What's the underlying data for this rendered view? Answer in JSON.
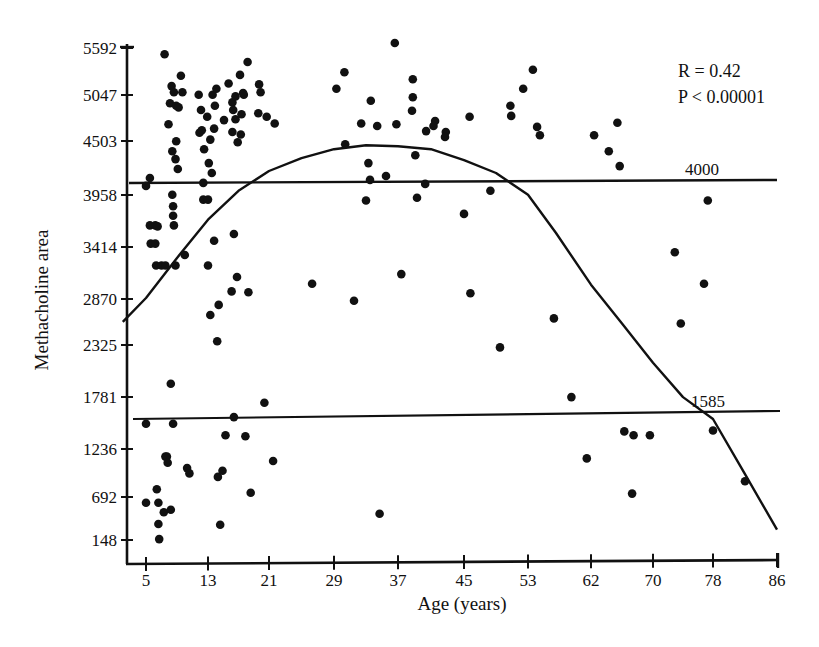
{
  "chart_data": {
    "type": "scatter",
    "title": "",
    "xlabel": "Age (years)",
    "ylabel": "Methacholine area",
    "x_ticks": [
      5,
      13,
      21,
      29,
      37,
      45,
      53,
      62,
      70,
      78,
      86
    ],
    "y_ticks": [
      148,
      692,
      1236,
      1781,
      2325,
      2870,
      3414,
      3958,
      4503,
      5047,
      5592
    ],
    "xlim": [
      2,
      86
    ],
    "ylim": [
      -100,
      5592
    ],
    "grid": false,
    "annotations": {
      "r_text": "R = 0.42",
      "p_text": "P < 0.00001"
    },
    "reference_lines": [
      {
        "label": "4000",
        "y_start": 4080,
        "y_end": 4100
      },
      {
        "label": "1585",
        "y_start": 1585,
        "y_end": 1640
      }
    ],
    "fit_curve": {
      "type": "quadratic",
      "points": [
        [
          2,
          2600
        ],
        [
          5,
          2880
        ],
        [
          9,
          3300
        ],
        [
          13,
          3700
        ],
        [
          17,
          4000
        ],
        [
          21,
          4200
        ],
        [
          25,
          4330
        ],
        [
          29,
          4420
        ],
        [
          33,
          4460
        ],
        [
          37,
          4450
        ],
        [
          41,
          4420
        ],
        [
          45,
          4310
        ],
        [
          49,
          4180
        ],
        [
          53,
          3960
        ],
        [
          57,
          3560
        ],
        [
          62,
          3020
        ],
        [
          66,
          2580
        ],
        [
          70,
          2140
        ],
        [
          74,
          1780
        ],
        [
          78,
          1550
        ],
        [
          82,
          950
        ],
        [
          86,
          280
        ]
      ]
    },
    "points": [
      [
        5,
        4050
      ],
      [
        5.5,
        4130
      ],
      [
        5,
        1500
      ],
      [
        5,
        620
      ],
      [
        5.5,
        3640
      ],
      [
        6.2,
        3640
      ],
      [
        5.6,
        3450
      ],
      [
        6.2,
        3450
      ],
      [
        6.3,
        3220
      ],
      [
        6.5,
        3630
      ],
      [
        7,
        3220
      ],
      [
        7.5,
        3220
      ],
      [
        6.4,
        780
      ],
      [
        6.6,
        620
      ],
      [
        6.7,
        160
      ],
      [
        6.6,
        350
      ],
      [
        7.4,
        5520
      ],
      [
        7.5,
        1150
      ],
      [
        7.7,
        1150
      ],
      [
        7.8,
        1080
      ],
      [
        7.3,
        500
      ],
      [
        8.2,
        530
      ],
      [
        8.2,
        1920
      ],
      [
        8.5,
        1500
      ],
      [
        7.9,
        4700
      ],
      [
        8.1,
        4950
      ],
      [
        8.3,
        5150
      ],
      [
        8.6,
        5080
      ],
      [
        8.9,
        4920
      ],
      [
        8.4,
        4400
      ],
      [
        8.8,
        4320
      ],
      [
        8.9,
        4500
      ],
      [
        9.2,
        4900
      ],
      [
        9.5,
        5270
      ],
      [
        9.7,
        5080
      ],
      [
        8.4,
        3960
      ],
      [
        8.5,
        3840
      ],
      [
        8.5,
        3740
      ],
      [
        8.6,
        3640
      ],
      [
        8.8,
        3220
      ],
      [
        9.1,
        4220
      ],
      [
        10,
        3330
      ],
      [
        10.3,
        1020
      ],
      [
        10.6,
        960
      ],
      [
        11.8,
        5050
      ],
      [
        12.1,
        4870
      ],
      [
        11.9,
        4600
      ],
      [
        12.5,
        4420
      ],
      [
        12.2,
        4630
      ],
      [
        12.9,
        4790
      ],
      [
        12.4,
        3910
      ],
      [
        13,
        3910
      ],
      [
        13.3,
        4520
      ],
      [
        13.8,
        4650
      ],
      [
        13.1,
        4280
      ],
      [
        13.9,
        4920
      ],
      [
        13.6,
        5050
      ],
      [
        14.1,
        5120
      ],
      [
        12.4,
        4080
      ],
      [
        13.5,
        4180
      ],
      [
        13.3,
        2680
      ],
      [
        13,
        3220
      ],
      [
        13.8,
        3480
      ],
      [
        14.2,
        2370
      ],
      [
        14.3,
        920
      ],
      [
        14.6,
        340
      ],
      [
        14.4,
        2800
      ],
      [
        15.3,
        1380
      ],
      [
        14.9,
        990
      ],
      [
        15.1,
        4750
      ],
      [
        15.7,
        5180
      ],
      [
        16.2,
        4960
      ],
      [
        16.3,
        4870
      ],
      [
        16.2,
        4610
      ],
      [
        16.6,
        4760
      ],
      [
        16.9,
        4490
      ],
      [
        17.3,
        4580
      ],
      [
        16.6,
        5030
      ],
      [
        17.2,
        5280
      ],
      [
        17.6,
        5070
      ],
      [
        17.7,
        5050
      ],
      [
        16.4,
        3550
      ],
      [
        16.8,
        3100
      ],
      [
        16.1,
        2950
      ],
      [
        16.4,
        1570
      ],
      [
        17.4,
        4820
      ],
      [
        18.3,
        2940
      ],
      [
        17.9,
        1370
      ],
      [
        18.6,
        740
      ],
      [
        18.2,
        5430
      ],
      [
        19.7,
        5170
      ],
      [
        19.9,
        5080
      ],
      [
        19.6,
        4830
      ],
      [
        20.4,
        1720
      ],
      [
        20.7,
        4790
      ],
      [
        21.7,
        4710
      ],
      [
        21.5,
        1100
      ],
      [
        26.3,
        3030
      ],
      [
        29.3,
        5120
      ],
      [
        30.3,
        5310
      ],
      [
        30.4,
        4470
      ],
      [
        31.5,
        2850
      ],
      [
        32.4,
        4710
      ],
      [
        33.3,
        4280
      ],
      [
        33,
        3900
      ],
      [
        33.5,
        4110
      ],
      [
        33.6,
        4980
      ],
      [
        34.4,
        4680
      ],
      [
        34.7,
        480
      ],
      [
        35.5,
        4150
      ],
      [
        36.6,
        5650
      ],
      [
        36.8,
        4700
      ],
      [
        37.4,
        3130
      ],
      [
        38.8,
        5230
      ],
      [
        38.8,
        5020
      ],
      [
        38.7,
        4860
      ],
      [
        39.1,
        4360
      ],
      [
        39.3,
        3930
      ],
      [
        40.4,
        4620
      ],
      [
        40.3,
        4070
      ],
      [
        41.5,
        4740
      ],
      [
        41.3,
        4680
      ],
      [
        42.8,
        4610
      ],
      [
        42.7,
        4550
      ],
      [
        45.8,
        2930
      ],
      [
        45,
        3760
      ],
      [
        45.7,
        4790
      ],
      [
        48.3,
        4000
      ],
      [
        49.5,
        2300
      ],
      [
        50.8,
        4920
      ],
      [
        50.9,
        4800
      ],
      [
        52.4,
        5120
      ],
      [
        53.7,
        5340
      ],
      [
        54.3,
        4670
      ],
      [
        54.7,
        4570
      ],
      [
        56.7,
        2640
      ],
      [
        59.2,
        1780
      ],
      [
        61.4,
        1130
      ],
      [
        62.4,
        4570
      ],
      [
        64.3,
        4400
      ],
      [
        65.4,
        4720
      ],
      [
        65.7,
        4250
      ],
      [
        66.3,
        1420
      ],
      [
        67.3,
        730
      ],
      [
        67.5,
        1380
      ],
      [
        69.6,
        1380
      ],
      [
        72.9,
        3360
      ],
      [
        73.7,
        2580
      ],
      [
        76.8,
        3030
      ],
      [
        77.3,
        3900
      ],
      [
        78,
        1430
      ],
      [
        82,
        870
      ]
    ]
  },
  "labels": {
    "xlabel": "Age (years)",
    "ylabel": "Methacholine area",
    "r_text": "R = 0.42",
    "p_text": "P < 0.00001",
    "ref_high": "4000",
    "ref_low": "1585",
    "x_ticks": [
      "5",
      "13",
      "21",
      "29",
      "37",
      "45",
      "53",
      "62",
      "70",
      "78",
      "86"
    ],
    "y_ticks": [
      "148",
      "692",
      "1236",
      "1781",
      "2325",
      "2870",
      "3414",
      "3958",
      "4503",
      "5047",
      "5592"
    ]
  }
}
